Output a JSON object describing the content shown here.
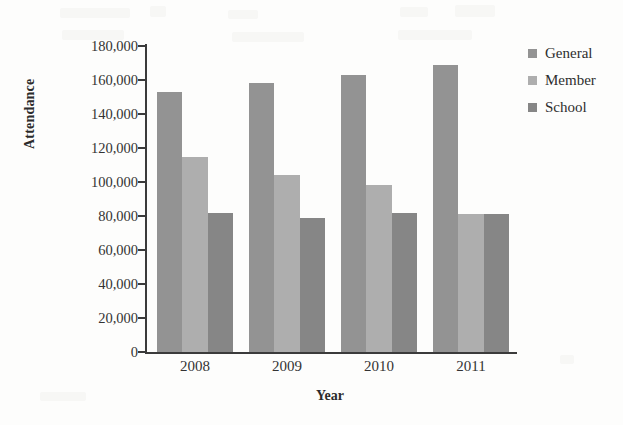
{
  "chart_data": {
    "type": "bar",
    "title": "",
    "xlabel": "Year",
    "ylabel": "Attendance",
    "categories": [
      "2008",
      "2009",
      "2010",
      "2011"
    ],
    "series": [
      {
        "name": "General",
        "color": "#939393",
        "values": [
          153000,
          158000,
          163000,
          169000
        ]
      },
      {
        "name": "Member",
        "color": "#aeaeae",
        "values": [
          115000,
          104000,
          98000,
          81000
        ]
      },
      {
        "name": "School",
        "color": "#868686",
        "values": [
          82000,
          79000,
          82000,
          81000
        ]
      }
    ],
    "ylim": [
      0,
      180000
    ],
    "ytick_values": [
      0,
      20000,
      40000,
      60000,
      80000,
      100000,
      120000,
      140000,
      160000,
      180000
    ],
    "ytick_labels": [
      "0",
      "20,000",
      "40,000",
      "60,000",
      "80,000",
      "100,000",
      "120,000",
      "140,000",
      "160,000",
      "180,000"
    ],
    "grid": false,
    "legend_position": "right"
  },
  "legend": {
    "items": [
      {
        "label": "General",
        "color": "#939393"
      },
      {
        "label": "Member",
        "color": "#aeaeae"
      },
      {
        "label": "School",
        "color": "#868686"
      }
    ]
  },
  "axes": {
    "x_title": "Year",
    "y_title": "Attendance"
  }
}
